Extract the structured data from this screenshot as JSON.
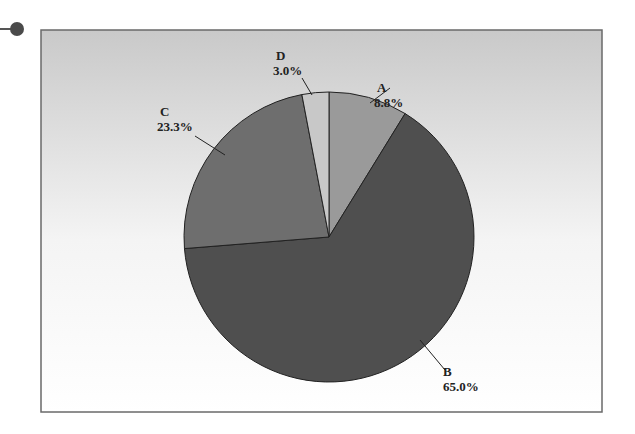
{
  "chart_data": {
    "type": "pie",
    "title": "",
    "categories": [
      "A",
      "B",
      "C",
      "D"
    ],
    "values": [
      8.8,
      65.0,
      23.3,
      3.0
    ],
    "labels": [
      "8.8%",
      "65.0%",
      "23.3%",
      "3.0%"
    ],
    "colors": [
      "#9a9a9a",
      "#4f4f4f",
      "#6e6e6e",
      "#c8c8c8"
    ],
    "start_angle_deg": 0,
    "direction": "clockwise",
    "legend": "none",
    "background": "vertical gradient gray to white"
  },
  "decor": {
    "marker": "filled-circle connector at top-left"
  }
}
